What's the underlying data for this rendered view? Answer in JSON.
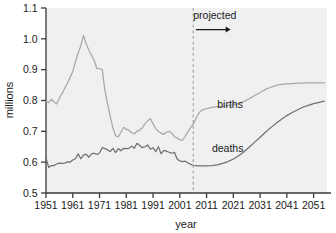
{
  "chart_data": {
    "type": "line",
    "title": "",
    "xlabel": "year",
    "ylabel": "millions",
    "xlim": [
      1951,
      2056
    ],
    "ylim": [
      0.5,
      1.1
    ],
    "xticks": [
      1951,
      1961,
      1971,
      1981,
      1991,
      2001,
      2011,
      2021,
      2031,
      2041,
      2051
    ],
    "xtick_labels": [
      "1951",
      "1961",
      "1971",
      "1981",
      "1991",
      "2001",
      "2011",
      "2021",
      "2031",
      "2041",
      "2051"
    ],
    "yticks": [
      0.5,
      0.6,
      0.7,
      0.8,
      0.9,
      1.0,
      1.1
    ],
    "ytick_labels": [
      "0.5",
      "0.6",
      "0.7",
      "0.8",
      "0.9",
      "1.0",
      "1.1"
    ],
    "grid": false,
    "legend_position": "inline-labels",
    "plot_background": "#f0f0f0",
    "annotations": [
      {
        "name": "projected-label",
        "text": "projected",
        "x": 2012,
        "y": 1.065
      },
      {
        "name": "projection-divider",
        "type": "vline",
        "x": 2006,
        "style": "dashed",
        "color": "#9a9a9a"
      },
      {
        "name": "projected-arrow",
        "type": "arrow",
        "x_start": 2007,
        "x_end": 2020,
        "y": 1.03
      }
    ],
    "series": [
      {
        "name": "births",
        "label": "births",
        "color": "#a8a8a8",
        "label_x": 2015,
        "label_y": 0.775,
        "x": [
          1951,
          1952,
          1953,
          1954,
          1955,
          1956,
          1957,
          1958,
          1959,
          1960,
          1961,
          1962,
          1963,
          1964,
          1965,
          1966,
          1967,
          1968,
          1969,
          1970,
          1971,
          1972,
          1973,
          1974,
          1975,
          1976,
          1977,
          1978,
          1979,
          1980,
          1981,
          1982,
          1983,
          1984,
          1985,
          1986,
          1987,
          1988,
          1989,
          1990,
          1991,
          1992,
          1993,
          1994,
          1995,
          1996,
          1997,
          1998,
          1999,
          2000,
          2001,
          2002,
          2003,
          2004,
          2005,
          2006,
          2007,
          2008,
          2009,
          2010,
          2011,
          2013,
          2015,
          2017,
          2019,
          2021,
          2023,
          2025,
          2027,
          2029,
          2031,
          2033,
          2035,
          2037,
          2039,
          2041,
          2043,
          2045,
          2047,
          2049,
          2051,
          2053,
          2055
        ],
        "values": [
          0.797,
          0.793,
          0.804,
          0.795,
          0.789,
          0.808,
          0.823,
          0.84,
          0.856,
          0.875,
          0.894,
          0.925,
          0.954,
          0.977,
          1.011,
          0.985,
          0.963,
          0.947,
          0.93,
          0.904,
          0.903,
          0.901,
          0.834,
          0.79,
          0.748,
          0.711,
          0.686,
          0.682,
          0.697,
          0.713,
          0.707,
          0.703,
          0.696,
          0.692,
          0.7,
          0.704,
          0.711,
          0.725,
          0.734,
          0.741,
          0.725,
          0.709,
          0.7,
          0.694,
          0.69,
          0.697,
          0.7,
          0.694,
          0.683,
          0.678,
          0.673,
          0.671,
          0.684,
          0.698,
          0.711,
          0.723,
          0.741,
          0.758,
          0.767,
          0.771,
          0.774,
          0.778,
          0.78,
          0.781,
          0.783,
          0.786,
          0.79,
          0.797,
          0.806,
          0.816,
          0.826,
          0.836,
          0.843,
          0.849,
          0.852,
          0.854,
          0.855,
          0.856,
          0.856,
          0.857,
          0.857,
          0.857,
          0.857
        ]
      },
      {
        "name": "deaths",
        "label": "deaths",
        "color": "#707070",
        "label_x": 2013,
        "label_y": 0.632,
        "x": [
          1951,
          1952,
          1953,
          1954,
          1955,
          1956,
          1957,
          1958,
          1959,
          1960,
          1961,
          1962,
          1963,
          1964,
          1965,
          1966,
          1967,
          1968,
          1969,
          1970,
          1971,
          1972,
          1973,
          1974,
          1975,
          1976,
          1977,
          1978,
          1979,
          1980,
          1981,
          1982,
          1983,
          1984,
          1985,
          1986,
          1987,
          1988,
          1989,
          1990,
          1991,
          1992,
          1993,
          1994,
          1995,
          1996,
          1997,
          1998,
          1999,
          2000,
          2001,
          2002,
          2003,
          2004,
          2005,
          2006,
          2007,
          2008,
          2009,
          2011,
          2013,
          2015,
          2017,
          2019,
          2021,
          2023,
          2025,
          2027,
          2029,
          2031,
          2033,
          2035,
          2037,
          2039,
          2041,
          2043,
          2045,
          2047,
          2049,
          2051,
          2053,
          2055
        ],
        "values": [
          0.614,
          0.583,
          0.589,
          0.589,
          0.594,
          0.597,
          0.596,
          0.597,
          0.601,
          0.6,
          0.607,
          0.611,
          0.627,
          0.611,
          0.623,
          0.626,
          0.616,
          0.627,
          0.629,
          0.625,
          0.63,
          0.647,
          0.644,
          0.64,
          0.634,
          0.645,
          0.631,
          0.644,
          0.637,
          0.645,
          0.644,
          0.645,
          0.652,
          0.645,
          0.661,
          0.654,
          0.647,
          0.65,
          0.656,
          0.642,
          0.647,
          0.634,
          0.65,
          0.627,
          0.638,
          0.636,
          0.632,
          0.629,
          0.632,
          0.61,
          0.604,
          0.602,
          0.603,
          0.598,
          0.593,
          0.59,
          0.589,
          0.588,
          0.588,
          0.588,
          0.589,
          0.591,
          0.596,
          0.602,
          0.61,
          0.621,
          0.634,
          0.649,
          0.665,
          0.681,
          0.697,
          0.712,
          0.726,
          0.739,
          0.751,
          0.761,
          0.77,
          0.778,
          0.784,
          0.79,
          0.794,
          0.798
        ]
      }
    ]
  }
}
